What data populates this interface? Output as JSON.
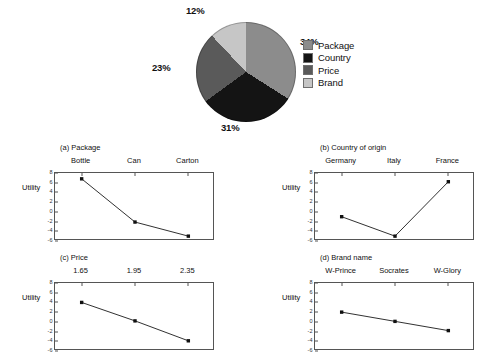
{
  "chart_data": [
    {
      "type": "pie",
      "title": "",
      "labels": [
        "Package",
        "Country",
        "Price",
        "Brand"
      ],
      "values": [
        34,
        31,
        23,
        12
      ],
      "value_labels": [
        "34%",
        "31%",
        "23%",
        "12%"
      ],
      "colors": [
        "#8c8c8c",
        "#141414",
        "#5a5a5a",
        "#c6c6c6"
      ],
      "legend_position": "right",
      "legend_entries": [
        {
          "label": "Package",
          "color": "#8c8c8c"
        },
        {
          "label": "Country",
          "color": "#141414"
        },
        {
          "label": "Price",
          "color": "#5a5a5a"
        },
        {
          "label": "Brand",
          "color": "#c6c6c6"
        }
      ]
    },
    {
      "type": "line",
      "title": "(a) Package",
      "ylabel": "Utility",
      "xlabel": "",
      "categories": [
        "Bottle",
        "Can",
        "Carton"
      ],
      "values": [
        6.8,
        -2.1,
        -5.0
      ],
      "ylim": [
        -6,
        8
      ],
      "yticks": [
        8,
        6,
        4,
        2,
        0,
        -2,
        -4,
        -6
      ],
      "ytick_labels": [
        "8",
        "6",
        "4",
        "2",
        "0",
        "-2",
        "-4",
        "-6"
      ],
      "grid": false,
      "xaxis_position": "top"
    },
    {
      "type": "line",
      "title": "(b) Country of origin",
      "ylabel": "Utility",
      "xlabel": "",
      "categories": [
        "Germany",
        "Italy",
        "France"
      ],
      "values": [
        -1.0,
        -5.0,
        6.2
      ],
      "ylim": [
        -6,
        8
      ],
      "yticks": [
        8,
        6,
        4,
        2,
        0,
        -2,
        -4,
        -6
      ],
      "ytick_labels": [
        "8",
        "6",
        "4",
        "2",
        "0",
        "-2",
        "-4",
        "-6"
      ],
      "grid": false,
      "xaxis_position": "top"
    },
    {
      "type": "line",
      "title": "(c) Price",
      "ylabel": "Utility",
      "xlabel": "",
      "categories": [
        "1.65",
        "1.95",
        "2.35"
      ],
      "values": [
        4.0,
        0.2,
        -3.9
      ],
      "ylim": [
        -6,
        8
      ],
      "yticks": [
        8,
        6,
        4,
        2,
        0,
        -2,
        -4,
        -6
      ],
      "ytick_labels": [
        "8",
        "6",
        "4",
        "2",
        "0",
        "-2",
        "-4",
        "-6"
      ],
      "grid": false,
      "xaxis_position": "top"
    },
    {
      "type": "line",
      "title": "(d) Brand name",
      "ylabel": "Utility",
      "xlabel": "",
      "categories": [
        "W-Prince",
        "Socrates",
        "W-Glory"
      ],
      "values": [
        2.0,
        0.1,
        -1.8
      ],
      "ylim": [
        -6,
        8
      ],
      "yticks": [
        8,
        6,
        4,
        2,
        0,
        -2,
        -4,
        -6
      ],
      "ytick_labels": [
        "8",
        "6",
        "4",
        "2",
        "0",
        "-2",
        "-4",
        "-6"
      ],
      "grid": false,
      "xaxis_position": "top"
    }
  ]
}
